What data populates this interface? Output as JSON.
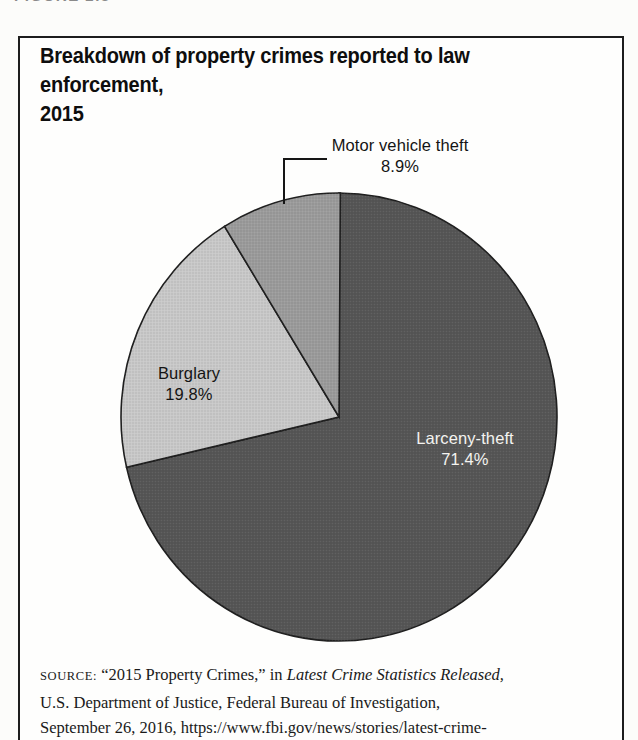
{
  "figure_label": "FIGURE 2.3",
  "panel": {
    "title_line1": "Breakdown of property crimes reported to law enforcement,",
    "title_line2": "2015"
  },
  "chart_data": {
    "type": "pie",
    "title": "Breakdown of property crimes reported to law enforcement, 2015",
    "slices": [
      {
        "label": "Larceny-theft",
        "value": 71.4,
        "display": "71.4%",
        "color": "#565656",
        "label_color": "#f4f3f0"
      },
      {
        "label": "Burglary",
        "value": 19.8,
        "display": "19.8%",
        "color": "#c9c9c9",
        "label_color": "#141414"
      },
      {
        "label": "Motor vehicle theft",
        "value": 8.9,
        "display": "8.9%",
        "color": "#9c9c9c",
        "label_color": "#141414"
      }
    ],
    "start_angle_deg": 0,
    "direction": "clockwise",
    "legend": "none",
    "outline_color": "#1f1f1f"
  },
  "source": {
    "label": "SOURCE:",
    "line1_pre": "“2015 Property Crimes,” in ",
    "line1_italic": "Latest Crime Statistics Released,",
    "line2": "U.S. Department of Justice, Federal Bureau of Investigation,",
    "line3": "September 26, 2016, https://www.fbi.gov/news/stories/latest-crime-"
  }
}
